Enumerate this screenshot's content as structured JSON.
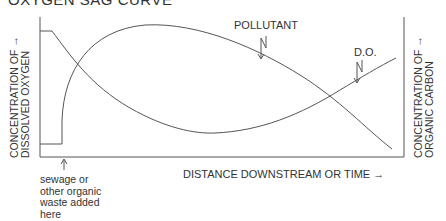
{
  "title": "OXYGEN SAG CURVE",
  "axes": {
    "left_label_line1": "CONCENTRATION OF →",
    "left_label_line2": "DISSOLVED OXYGEN",
    "right_label_line1": "CONCENTRATION OF →",
    "right_label_line2": "ORGANIC CARBON",
    "x_label": "DISTANCE DOWNSTREAM OR TIME →"
  },
  "curves": {
    "pollutant_label": "POLLUTANT",
    "do_label": "D.O."
  },
  "annotation": {
    "line1": "sewage or",
    "line2": "other organic",
    "line3": "waste added",
    "line4": "here"
  },
  "colors": {
    "line": "#555555",
    "text": "#333333"
  }
}
